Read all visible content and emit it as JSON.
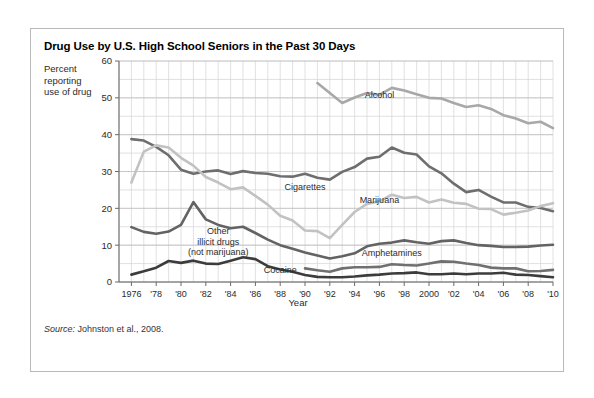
{
  "figure": {
    "title": "Drug Use by U.S. High School Seniors in the Past 30 Days",
    "y_caption": "Percent\nreporting\nuse of drug",
    "source_prefix": "Source:",
    "source_text": " Johnston et al., 2008."
  },
  "chart_data": {
    "type": "line",
    "title": "Drug Use by U.S. High School Seniors in the Past 30 Days",
    "xlabel": "Year",
    "ylabel": "Percent reporting use of drug",
    "xlim": [
      1975,
      2010
    ],
    "ylim": [
      0,
      60
    ],
    "ytick_values": [
      0,
      10,
      20,
      30,
      40,
      50,
      60
    ],
    "ytick_labels": [
      "0",
      "10",
      "20",
      "30",
      "40",
      "50",
      "60"
    ],
    "y_minor_step": 5,
    "xtick_values": [
      1976,
      1978,
      1980,
      1982,
      1984,
      1986,
      1988,
      1990,
      1992,
      1994,
      1996,
      1998,
      2000,
      2002,
      2004,
      2006,
      2008,
      2010
    ],
    "xtick_labels": [
      "1976",
      "'78",
      "'80",
      "'82",
      "'84",
      "'86",
      "'88",
      "'90",
      "'92",
      "'94",
      "'96",
      "'98",
      "2000",
      "'02",
      "'04",
      "'06",
      "'08",
      "'10"
    ],
    "x_minor_step": 1,
    "grid": true,
    "legend": "inline-labels",
    "colors": {
      "alcohol": "#a8a8a8",
      "cigarettes": "#6e6e6e",
      "marijuana": "#c2c2c2",
      "other_illicit": "#636363",
      "amphetamines": "#707070",
      "cocaine": "#3c3c3c",
      "grid": "#d4d4d4",
      "axis": "#6a6a6a"
    },
    "series": [
      {
        "name": "Alcohol",
        "color": "#a8a8a8",
        "label_x": 1996,
        "label_y": 50.5,
        "x": [
          1991,
          1992,
          1993,
          1994,
          1995,
          1996,
          1997,
          1998,
          1999,
          2000,
          2001,
          2002,
          2003,
          2004,
          2005,
          2006,
          2007,
          2008,
          2009,
          2010
        ],
        "values": [
          54.0,
          51.3,
          48.6,
          50.1,
          51.3,
          50.8,
          52.7,
          52.0,
          51.0,
          50.0,
          49.8,
          48.6,
          47.5,
          48.0,
          47.0,
          45.3,
          44.4,
          43.1,
          43.5,
          41.8
        ]
      },
      {
        "name": "Cigarettes",
        "color": "#6e6e6e",
        "label_x": 1990,
        "label_y": 25.5,
        "x": [
          1976,
          1977,
          1978,
          1979,
          1980,
          1981,
          1982,
          1983,
          1984,
          1985,
          1986,
          1987,
          1988,
          1989,
          1990,
          1991,
          1992,
          1993,
          1994,
          1995,
          1996,
          1997,
          1998,
          1999,
          2000,
          2001,
          2002,
          2003,
          2004,
          2005,
          2006,
          2007,
          2008,
          2009,
          2010
        ],
        "values": [
          38.8,
          38.4,
          36.7,
          34.4,
          30.5,
          29.4,
          30.0,
          30.3,
          29.3,
          30.1,
          29.6,
          29.4,
          28.7,
          28.6,
          29.4,
          28.3,
          27.8,
          29.9,
          31.2,
          33.5,
          34.0,
          36.5,
          35.1,
          34.6,
          31.4,
          29.5,
          26.7,
          24.4,
          25.0,
          23.2,
          21.6,
          21.6,
          20.4,
          20.1,
          19.2
        ]
      },
      {
        "name": "Marijuana",
        "color": "#c2c2c2",
        "label_x": 1996,
        "label_y": 22.0,
        "x": [
          1976,
          1977,
          1978,
          1979,
          1980,
          1981,
          1982,
          1983,
          1984,
          1985,
          1986,
          1987,
          1988,
          1989,
          1990,
          1991,
          1992,
          1993,
          1994,
          1995,
          1996,
          1997,
          1998,
          1999,
          2000,
          2001,
          2002,
          2003,
          2004,
          2005,
          2006,
          2007,
          2008,
          2009,
          2010
        ],
        "values": [
          27.0,
          35.4,
          37.1,
          36.5,
          33.7,
          31.6,
          28.5,
          27.0,
          25.2,
          25.7,
          23.4,
          21.0,
          18.0,
          16.7,
          14.0,
          13.8,
          11.9,
          15.5,
          19.0,
          21.2,
          21.9,
          23.7,
          22.8,
          23.1,
          21.6,
          22.4,
          21.5,
          21.2,
          19.9,
          19.8,
          18.3,
          18.8,
          19.4,
          20.6,
          21.4
        ]
      },
      {
        "name": "Other illicit drugs (not marijuana)",
        "color": "#636363",
        "label_x": 1983,
        "label_y": 13.5,
        "x": [
          1976,
          1977,
          1978,
          1979,
          1980,
          1981,
          1982,
          1983,
          1984,
          1985,
          1986,
          1987,
          1988,
          1989,
          1990,
          1991,
          1992,
          1993,
          1994,
          1995,
          1996,
          1997,
          1998,
          1999,
          2000,
          2001,
          2002,
          2003,
          2004,
          2005,
          2006,
          2007,
          2008,
          2009,
          2010
        ],
        "values": [
          14.9,
          13.6,
          13.1,
          13.7,
          15.5,
          21.7,
          17.0,
          15.5,
          14.6,
          15.0,
          13.3,
          11.5,
          10.0,
          9.0,
          8.0,
          7.2,
          6.4,
          7.0,
          7.8,
          9.7,
          10.4,
          10.7,
          11.3,
          10.8,
          10.4,
          11.1,
          11.3,
          10.6,
          10.0,
          9.8,
          9.5,
          9.5,
          9.6,
          9.9,
          10.1
        ]
      },
      {
        "name": "Amphetamines",
        "color": "#707070",
        "label_x": 1997,
        "label_y": 7.5,
        "x": [
          1990,
          1991,
          1992,
          1993,
          1994,
          1995,
          1996,
          1997,
          1998,
          1999,
          2000,
          2001,
          2002,
          2003,
          2004,
          2005,
          2006,
          2007,
          2008,
          2009,
          2010
        ],
        "values": [
          3.7,
          3.2,
          2.8,
          3.7,
          4.0,
          4.0,
          4.1,
          4.8,
          4.6,
          4.5,
          5.0,
          5.6,
          5.5,
          5.0,
          4.6,
          3.9,
          3.7,
          3.7,
          2.9,
          3.0,
          3.3
        ]
      },
      {
        "name": "Cocaine",
        "color": "#3c3c3c",
        "label_x": 1988,
        "label_y": 3.0,
        "x": [
          1976,
          1977,
          1978,
          1979,
          1980,
          1981,
          1982,
          1983,
          1984,
          1985,
          1986,
          1987,
          1988,
          1989,
          1990,
          1991,
          1992,
          1993,
          1994,
          1995,
          1996,
          1997,
          1998,
          1999,
          2000,
          2001,
          2002,
          2003,
          2004,
          2005,
          2006,
          2007,
          2008,
          2009,
          2010
        ],
        "values": [
          2.0,
          2.9,
          3.9,
          5.7,
          5.2,
          5.8,
          5.0,
          4.9,
          5.8,
          6.7,
          6.2,
          4.3,
          3.4,
          2.8,
          1.9,
          1.4,
          1.3,
          1.3,
          1.5,
          1.8,
          2.0,
          2.3,
          2.4,
          2.6,
          2.1,
          2.1,
          2.3,
          2.1,
          2.3,
          2.3,
          2.5,
          2.0,
          1.9,
          1.6,
          1.3
        ]
      }
    ],
    "annotations": [
      {
        "text": "Alcohol",
        "x": 1996,
        "y": 50.5
      },
      {
        "text": "Cigarettes",
        "x": 1990,
        "y": 25.5
      },
      {
        "text": "Marijuana",
        "x": 1996,
        "y": 22.0
      },
      {
        "text": "Other\nillicit drugs\n(not marijuana)",
        "x": 1983,
        "y": 13.5
      },
      {
        "text": "Amphetamines",
        "x": 1997,
        "y": 7.5
      },
      {
        "text": "Cocaine",
        "x": 1988,
        "y": 3.0
      }
    ]
  }
}
